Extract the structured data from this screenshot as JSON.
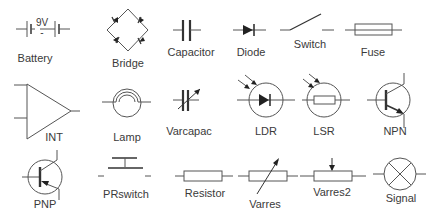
{
  "palette": {
    "title": "Electronic component symbols",
    "colors": {
      "background": "#ffffff",
      "stroke": "#555555",
      "text": "#3a3a3a"
    },
    "items": [
      {
        "id": "battery",
        "label": "Battery",
        "value_text": "9V",
        "icon": "battery-icon",
        "label_pos": [
          35,
          58
        ]
      },
      {
        "id": "bridge",
        "label": "Bridge",
        "icon": "bridge-rectifier-icon",
        "label_pos": [
          128,
          64
        ]
      },
      {
        "id": "capacitor",
        "label": "Capacitor",
        "icon": "capacitor-icon",
        "label_pos": [
          191,
          52
        ]
      },
      {
        "id": "diode",
        "label": "Diode",
        "icon": "diode-icon",
        "label_pos": [
          251,
          52
        ]
      },
      {
        "id": "switch",
        "label": "Switch",
        "icon": "switch-icon",
        "label_pos": [
          310,
          44
        ]
      },
      {
        "id": "fuse",
        "label": "Fuse",
        "icon": "fuse-icon",
        "label_pos": [
          373,
          52
        ]
      },
      {
        "id": "int",
        "label": "INT",
        "icon": "integrator-opamp-icon",
        "label_pos": [
          54,
          137
        ]
      },
      {
        "id": "lamp",
        "label": "Lamp",
        "icon": "lamp-icon",
        "label_pos": [
          127,
          137
        ]
      },
      {
        "id": "varcapac",
        "label": "Varcapac",
        "icon": "variable-capacitor-icon",
        "label_pos": [
          189,
          131
        ]
      },
      {
        "id": "ldr",
        "label": "LDR",
        "icon": "ldr-icon",
        "label_pos": [
          266,
          131
        ]
      },
      {
        "id": "lsr",
        "label": "LSR",
        "icon": "lsr-icon",
        "label_pos": [
          324,
          131
        ]
      },
      {
        "id": "npn",
        "label": "NPN",
        "icon": "npn-transistor-icon",
        "label_pos": [
          395,
          131
        ]
      },
      {
        "id": "pnp",
        "label": "PNP",
        "icon": "pnp-transistor-icon",
        "label_pos": [
          45,
          204
        ]
      },
      {
        "id": "prswitch",
        "label": "PRswitch",
        "icon": "push-switch-icon",
        "label_pos": [
          126,
          194
        ]
      },
      {
        "id": "resistor",
        "label": "Resistor",
        "icon": "resistor-icon",
        "label_pos": [
          205,
          193
        ]
      },
      {
        "id": "varres",
        "label": "Varres",
        "icon": "variable-resistor-icon",
        "label_pos": [
          265,
          204
        ]
      },
      {
        "id": "varres2",
        "label": "Varres2",
        "icon": "potentiometer-icon",
        "label_pos": [
          332,
          192
        ]
      },
      {
        "id": "signal",
        "label": "Signal",
        "icon": "signal-lamp-icon",
        "label_pos": [
          401,
          198
        ]
      }
    ]
  }
}
